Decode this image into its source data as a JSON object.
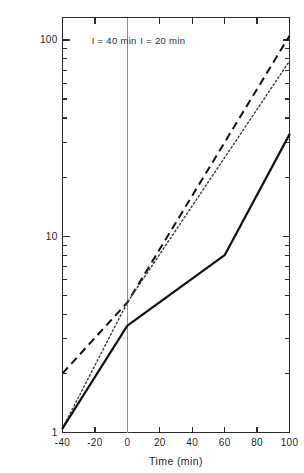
{
  "chart_data": {
    "type": "line",
    "title": "",
    "xlabel": "Time (min)",
    "ylabel": "",
    "yscale": "log",
    "xlim": [
      -40,
      100
    ],
    "ylim": [
      1,
      130
    ],
    "grid": false,
    "legend": "none",
    "x_ticks": [
      -40,
      -20,
      0,
      20,
      40,
      60,
      80,
      100
    ],
    "x_tick_labels": [
      "-40",
      "-20",
      "0",
      "20",
      "40",
      "60",
      "80",
      "100"
    ],
    "y_ticks": [
      1,
      10,
      100
    ],
    "y_tick_labels": [
      "1",
      "10",
      "100"
    ],
    "y_minor_ticks": [
      2,
      3,
      4,
      5,
      6,
      7,
      8,
      9,
      20,
      30,
      40,
      50,
      60,
      70,
      80,
      90,
      100
    ],
    "annotations": [
      {
        "text": "I = 40 min",
        "x": -22,
        "y": 95
      },
      {
        "text": "I = 20 min",
        "x": 8,
        "y": 95
      }
    ],
    "divider_x": 0,
    "series": [
      {
        "name": "dashed-curve",
        "style": "dashed",
        "x": [
          -40,
          0,
          100
        ],
        "values": [
          2.0,
          4.6,
          105
        ]
      },
      {
        "name": "dotted-curve",
        "style": "dotted",
        "x": [
          -40,
          0,
          100
        ],
        "values": [
          1.05,
          4.6,
          78
        ]
      },
      {
        "name": "solid-curve",
        "style": "solid",
        "x": [
          -40,
          0,
          60,
          100
        ],
        "values": [
          1.05,
          3.5,
          8.0,
          33
        ]
      }
    ]
  },
  "axis": {
    "x_title": "Time (min)"
  },
  "annotations": {
    "left_panel": "I = 40 min",
    "right_panel": "I = 20 min"
  },
  "ticks": {
    "y_label_100": "100",
    "y_label_10": "10",
    "y_label_1": "1",
    "x_label_m40": "-40",
    "x_label_m20": "-20",
    "x_label_0": "0",
    "x_label_20": "20",
    "x_label_40": "40",
    "x_label_60": "60",
    "x_label_80": "80",
    "x_label_100": "100"
  },
  "colors": {
    "axis": "#2b2b2b",
    "solid": "#111111",
    "dashed": "#111111",
    "dotted": "#444444",
    "divider": "#8f8f8f",
    "background": "#ffffff"
  }
}
